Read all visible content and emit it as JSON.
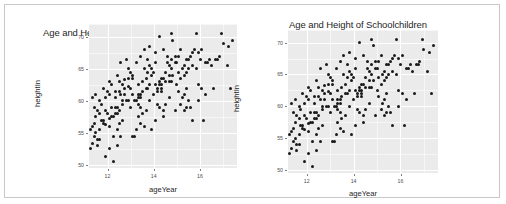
{
  "figure": {
    "background": "#ffffff",
    "border_color": "#c8c8c8",
    "panel_color": "#ebebeb",
    "grid_color": "#ffffff",
    "point_color": "#1a1a1a"
  },
  "panels": [
    {
      "name": "left-plot",
      "title": "Age and Height of Schoolchildren",
      "xlabel": "ageYear",
      "ylabel": "heightIn",
      "xticks": [
        "12",
        "14",
        "16"
      ],
      "yticks": [
        "70",
        "65",
        "60",
        "55",
        "50"
      ]
    },
    {
      "name": "right-plot",
      "title": "Age and Height of Schoolchildren",
      "xlabel": "ageYear",
      "ylabel": "heightIn",
      "xticks": [
        "12",
        "14",
        "16"
      ],
      "yticks": [
        "70",
        "65",
        "60",
        "55",
        "50"
      ]
    }
  ],
  "chart_data": {
    "type": "scatter",
    "title": "Age and Height of Schoolchildren",
    "xlabel": "ageYear",
    "ylabel": "heightIn",
    "xlim": [
      11.2,
      17.6
    ],
    "ylim": [
      49.5,
      72.0
    ],
    "xticks": [
      12,
      14,
      16
    ],
    "yticks": [
      50,
      55,
      60,
      65,
      70
    ],
    "grid": true,
    "legend": "none",
    "repeated_panels": 2,
    "series": [
      {
        "name": "heightweight",
        "points": [
          [
            11.92,
            56.3
          ],
          [
            12.92,
            62.3
          ],
          [
            12.75,
            63.3
          ],
          [
            13.42,
            59.0
          ],
          [
            15.92,
            62.5
          ],
          [
            14.25,
            62.5
          ],
          [
            15.42,
            59.0
          ],
          [
            11.83,
            56.5
          ],
          [
            13.33,
            62.5
          ],
          [
            11.67,
            54.0
          ],
          [
            12.67,
            60.0
          ],
          [
            12.17,
            57.5
          ],
          [
            11.58,
            54.0
          ],
          [
            12.92,
            60.0
          ],
          [
            13.83,
            60.0
          ],
          [
            14.33,
            62.0
          ],
          [
            11.42,
            56.5
          ],
          [
            12.42,
            59.0
          ],
          [
            13.42,
            61.0
          ],
          [
            14.17,
            62.0
          ],
          [
            11.75,
            57.0
          ],
          [
            12.75,
            61.0
          ],
          [
            13.75,
            62.0
          ],
          [
            14.75,
            63.0
          ],
          [
            12.08,
            57.3
          ],
          [
            13.08,
            61.0
          ],
          [
            14.08,
            62.5
          ],
          [
            15.08,
            64.5
          ],
          [
            11.5,
            55.0
          ],
          [
            12.5,
            58.5
          ],
          [
            13.5,
            61.5
          ],
          [
            14.5,
            63.0
          ],
          [
            15.5,
            65.0
          ],
          [
            11.33,
            53.3
          ],
          [
            12.33,
            58.0
          ],
          [
            13.33,
            60.5
          ],
          [
            14.33,
            63.5
          ],
          [
            15.33,
            65.5
          ],
          [
            16.33,
            66.0
          ],
          [
            11.67,
            55.5
          ],
          [
            12.67,
            59.5
          ],
          [
            13.67,
            62.0
          ],
          [
            14.67,
            64.0
          ],
          [
            15.67,
            65.5
          ],
          [
            16.67,
            66.5
          ],
          [
            11.25,
            52.5
          ],
          [
            12.25,
            57.5
          ],
          [
            13.25,
            60.0
          ],
          [
            14.25,
            63.0
          ],
          [
            15.25,
            65.0
          ],
          [
            16.25,
            66.0
          ],
          [
            17.25,
            68.5
          ],
          [
            11.42,
            54.5
          ],
          [
            12.42,
            58.0
          ],
          [
            13.42,
            60.5
          ],
          [
            14.42,
            63.5
          ],
          [
            15.42,
            64.5
          ],
          [
            16.42,
            66.5
          ],
          [
            17.42,
            69.5
          ],
          [
            11.83,
            57.0
          ],
          [
            12.83,
            60.0
          ],
          [
            13.83,
            62.5
          ],
          [
            14.83,
            64.0
          ],
          [
            15.83,
            65.0
          ],
          [
            16.83,
            67.0
          ],
          [
            12.0,
            61.5
          ],
          [
            13.0,
            62.0
          ],
          [
            14.0,
            64.5
          ],
          [
            15.0,
            66.0
          ],
          [
            16.0,
            66.5
          ],
          [
            11.58,
            58.5
          ],
          [
            12.58,
            61.0
          ],
          [
            13.58,
            65.0
          ],
          [
            14.58,
            66.0
          ],
          [
            15.58,
            67.0
          ],
          [
            11.75,
            59.5
          ],
          [
            12.75,
            62.0
          ],
          [
            13.75,
            64.5
          ],
          [
            14.75,
            66.5
          ],
          [
            15.75,
            68.0
          ],
          [
            11.92,
            60.5
          ],
          [
            12.92,
            63.5
          ],
          [
            13.92,
            65.0
          ],
          [
            14.92,
            67.0
          ],
          [
            15.92,
            67.5
          ],
          [
            12.08,
            61.0
          ],
          [
            13.08,
            64.0
          ],
          [
            14.08,
            66.0
          ],
          [
            15.08,
            67.0
          ],
          [
            16.08,
            68.0
          ],
          [
            11.33,
            56.0
          ],
          [
            12.33,
            59.0
          ],
          [
            13.33,
            59.5
          ],
          [
            14.33,
            61.5
          ],
          [
            15.33,
            61.0
          ],
          [
            11.5,
            57.5
          ],
          [
            12.5,
            56.5
          ],
          [
            13.5,
            58.0
          ],
          [
            14.5,
            59.5
          ],
          [
            15.5,
            60.0
          ],
          [
            11.67,
            58.0
          ],
          [
            12.67,
            57.0
          ],
          [
            13.67,
            58.5
          ],
          [
            14.67,
            60.5
          ],
          [
            15.67,
            57.0
          ],
          [
            11.42,
            59.0
          ],
          [
            12.42,
            55.5
          ],
          [
            13.42,
            56.5
          ],
          [
            14.42,
            58.5
          ],
          [
            15.42,
            62.0
          ],
          [
            11.25,
            55.5
          ],
          [
            12.25,
            54.5
          ],
          [
            13.25,
            55.5
          ],
          [
            14.25,
            59.0
          ],
          [
            16.58,
            62.0
          ],
          [
            11.92,
            51.3
          ],
          [
            12.25,
            50.5
          ],
          [
            12.08,
            52.5
          ],
          [
            11.58,
            53.0
          ],
          [
            12.58,
            54.5
          ],
          [
            13.17,
            54.5
          ],
          [
            13.58,
            56.0
          ],
          [
            14.08,
            57.0
          ],
          [
            14.92,
            58.5
          ],
          [
            15.17,
            59.5
          ],
          [
            12.0,
            58.0
          ],
          [
            12.17,
            59.0
          ],
          [
            12.33,
            60.5
          ],
          [
            12.5,
            61.5
          ],
          [
            12.67,
            62.5
          ],
          [
            13.0,
            59.0
          ],
          [
            13.17,
            60.0
          ],
          [
            13.33,
            61.0
          ],
          [
            13.5,
            63.0
          ],
          [
            13.67,
            63.5
          ],
          [
            14.0,
            61.0
          ],
          [
            14.17,
            61.5
          ],
          [
            14.33,
            62.5
          ],
          [
            14.5,
            64.5
          ],
          [
            14.67,
            65.5
          ],
          [
            15.0,
            62.5
          ],
          [
            15.17,
            63.5
          ],
          [
            15.33,
            64.0
          ],
          [
            15.5,
            66.5
          ],
          [
            15.67,
            67.5
          ],
          [
            11.83,
            62.0
          ],
          [
            12.83,
            66.5
          ],
          [
            13.83,
            68.5
          ],
          [
            14.83,
            69.5
          ],
          [
            15.83,
            70.5
          ],
          [
            12.42,
            64.0
          ],
          [
            13.42,
            67.0
          ],
          [
            14.42,
            68.0
          ],
          [
            16.92,
            70.5
          ],
          [
            17.17,
            65.5
          ],
          [
            11.67,
            60.0
          ],
          [
            12.5,
            63.0
          ],
          [
            13.25,
            66.0
          ],
          [
            14.08,
            67.5
          ],
          [
            14.92,
            66.0
          ],
          [
            12.08,
            63.0
          ],
          [
            12.92,
            65.0
          ],
          [
            13.75,
            66.5
          ],
          [
            14.58,
            67.0
          ],
          [
            15.42,
            66.5
          ],
          [
            11.5,
            61.0
          ],
          [
            12.33,
            61.5
          ],
          [
            13.08,
            63.5
          ],
          [
            13.92,
            64.0
          ],
          [
            14.75,
            65.0
          ],
          [
            11.33,
            60.5
          ],
          [
            12.17,
            62.5
          ],
          [
            13.0,
            64.5
          ],
          [
            13.83,
            65.5
          ],
          [
            14.67,
            63.0
          ],
          [
            15.08,
            61.5
          ],
          [
            15.25,
            60.5
          ],
          [
            15.58,
            59.0
          ],
          [
            15.92,
            60.0
          ],
          [
            16.08,
            62.0
          ],
          [
            16.25,
            61.0
          ],
          [
            16.5,
            65.5
          ],
          [
            16.75,
            66.5
          ],
          [
            17.0,
            69.0
          ],
          [
            17.33,
            62.0
          ],
          [
            13.58,
            68.0
          ],
          [
            14.25,
            70.0
          ],
          [
            14.75,
            70.5
          ],
          [
            15.17,
            68.0
          ],
          [
            12.58,
            66.0
          ],
          [
            11.92,
            58.5
          ],
          [
            12.08,
            56.0
          ],
          [
            12.42,
            53.0
          ],
          [
            13.08,
            54.5
          ],
          [
            13.92,
            55.5
          ],
          [
            14.42,
            57.5
          ],
          [
            15.33,
            58.5
          ],
          [
            16.17,
            57.0
          ],
          [
            14.17,
            59.5
          ],
          [
            13.33,
            57.5
          ]
        ]
      }
    ]
  }
}
